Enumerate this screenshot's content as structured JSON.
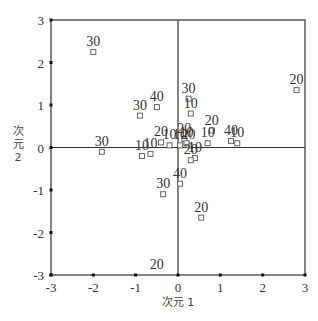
{
  "chart_data": {
    "type": "scatter",
    "title": "",
    "xlabel": "次元 1",
    "ylabel": "次元 2",
    "xlim": [
      -3,
      3
    ],
    "ylim": [
      -3,
      3
    ],
    "xticks": [
      -3,
      -2,
      -1,
      0,
      1,
      2,
      3
    ],
    "yticks": [
      3,
      2,
      1,
      0,
      -1,
      -2,
      -3
    ],
    "grid": false,
    "reference_lines": {
      "x": 0,
      "y": 0
    },
    "legend": null,
    "marker": "hollow-square",
    "points": [
      {
        "label": "30",
        "x": -2.0,
        "y": 2.25
      },
      {
        "label": "20",
        "x": 2.8,
        "y": 1.35
      },
      {
        "label": "30",
        "x": -1.8,
        "y": -0.1
      },
      {
        "label": "40",
        "x": -0.5,
        "y": 0.95
      },
      {
        "label": "30",
        "x": -0.9,
        "y": 0.75
      },
      {
        "label": "10",
        "x": -0.85,
        "y": -0.2
      },
      {
        "label": "10",
        "x": -0.65,
        "y": -0.15
      },
      {
        "label": "20",
        "x": -0.4,
        "y": 0.12
      },
      {
        "label": "10",
        "x": -0.2,
        "y": 0.05
      },
      {
        "label": "30",
        "x": 0.25,
        "y": 1.15
      },
      {
        "label": "10",
        "x": 0.3,
        "y": 0.8
      },
      {
        "label": "20",
        "x": 0.8,
        "y": 0.4
      },
      {
        "label": "10",
        "x": 0.7,
        "y": 0.1
      },
      {
        "label": "20",
        "x": 0.15,
        "y": 0.2
      },
      {
        "label": "10",
        "x": 0.05,
        "y": 0.05
      },
      {
        "label": "20",
        "x": 0.25,
        "y": 0.05
      },
      {
        "label": "10",
        "x": 0.2,
        "y": 0.1
      },
      {
        "label": "40",
        "x": 1.25,
        "y": 0.15
      },
      {
        "label": "10",
        "x": 1.4,
        "y": 0.1
      },
      {
        "label": "10",
        "x": 0.4,
        "y": -0.25
      },
      {
        "label": "20",
        "x": 0.3,
        "y": -0.3
      },
      {
        "label": "40",
        "x": 0.05,
        "y": -0.85
      },
      {
        "label": "30",
        "x": -0.35,
        "y": -1.1
      },
      {
        "label": "20",
        "x": 0.55,
        "y": -1.65
      },
      {
        "label": "20",
        "x": -0.5,
        "y": -3.0
      }
    ]
  },
  "layout": {
    "plot": {
      "left": 51,
      "top": 20,
      "right": 305,
      "bottom": 275
    },
    "colors": {
      "frame": "#333333",
      "marker": "#555555",
      "text": "#333333"
    }
  }
}
